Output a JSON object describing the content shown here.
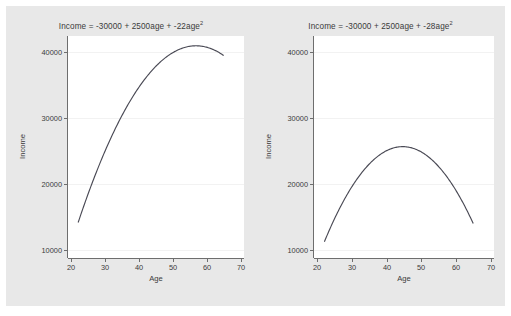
{
  "window": {
    "background_color": "#e8e8e8",
    "page_background_color": "#ffffff",
    "plot_background_color": "#ffffff"
  },
  "chart_data": [
    {
      "type": "line",
      "title": "Income = -30000 + 2500age + -22age",
      "title_exponent": "2",
      "equation": {
        "intercept": -30000,
        "linear_coefficient": 2500,
        "quadratic_coefficient": -22,
        "predictor": "age",
        "response": "Income"
      },
      "xlabel": "Age",
      "ylabel": "Income",
      "xlim": [
        19,
        71
      ],
      "ylim": [
        9000,
        42500
      ],
      "xticks": [
        20,
        30,
        40,
        50,
        60,
        70
      ],
      "xtick_labels": [
        "20",
        "30",
        "40",
        "50",
        "60",
        "70"
      ],
      "yticks": [
        10000,
        20000,
        30000,
        40000
      ],
      "ytick_labels": [
        "10000",
        "20000",
        "30000",
        "40000"
      ],
      "grid": true,
      "legend": "none",
      "line_color": "#4a4a55",
      "x": [
        22,
        25,
        28,
        31,
        34,
        37,
        40,
        43,
        46,
        49,
        52,
        55,
        57,
        58,
        61,
        64,
        65
      ],
      "values": [
        14352,
        18250,
        21752,
        24858,
        27568,
        29882,
        31800,
        33322,
        34448,
        35178,
        35512,
        35450,
        35200,
        35008,
        33970,
        32536,
        31950
      ],
      "peak": {
        "x": 56.8,
        "y": 41023
      }
    },
    {
      "type": "line",
      "title": "Income = -30000 + 2500age + -28age",
      "title_exponent": "2",
      "equation": {
        "intercept": -30000,
        "linear_coefficient": 2500,
        "quadratic_coefficient": -28,
        "predictor": "age",
        "response": "Income"
      },
      "xlabel": "Age",
      "ylabel": "Income",
      "xlim": [
        19,
        71
      ],
      "ylim": [
        9000,
        42500
      ],
      "xticks": [
        20,
        30,
        40,
        50,
        60,
        70
      ],
      "xtick_labels": [
        "20",
        "30",
        "40",
        "50",
        "60",
        "70"
      ],
      "yticks": [
        10000,
        20000,
        30000,
        40000
      ],
      "ytick_labels": [
        "10000",
        "20000",
        "30000",
        "40000"
      ],
      "grid": true,
      "legend": "none",
      "line_color": "#4a4a55",
      "x": [
        22,
        25,
        28,
        31,
        34,
        37,
        40,
        43,
        44.6,
        46,
        49,
        52,
        55,
        58,
        61,
        64,
        65
      ],
      "values": [
        11448,
        15000,
        18048,
        20592,
        22632,
        24168,
        25200,
        25728,
        25804,
        25752,
        25272,
        24288,
        22800,
        20808,
        18312,
        15312,
        14200
      ],
      "peak": {
        "x": 44.6,
        "y": 25804
      }
    }
  ]
}
